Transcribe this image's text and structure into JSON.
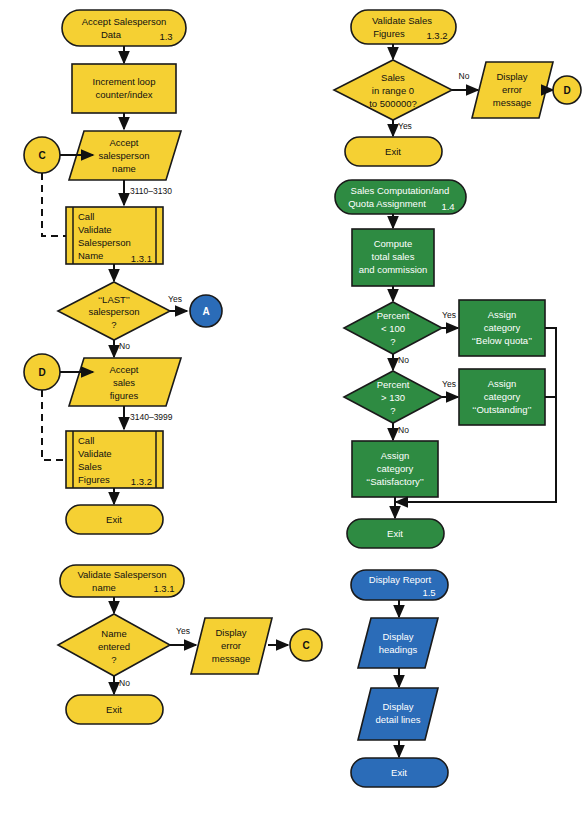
{
  "diagram": {
    "colors": {
      "yellow": "#F5D033",
      "green": "#2E8B42",
      "blue": "#2B6CB8",
      "stroke": "#111111",
      "background": "#FFFFFF"
    }
  },
  "module_1_3": {
    "terminator_start": {
      "line1": "Accept Salesperson",
      "line2": "Data",
      "ref": "1.3"
    },
    "process_increment": {
      "line1": "Increment loop",
      "line2": "counter/index"
    },
    "io_accept_name": {
      "line1": "Accept",
      "line2": "salesperson",
      "line3": "name"
    },
    "line_ref_1": "3110–3130",
    "predefined_validate_name": {
      "line1": "Call",
      "line2": "Validate",
      "line3": "Salesperson",
      "line4": "Name",
      "ref": "1.3.1"
    },
    "decision_last": {
      "line1": "‘‘LAST’’",
      "line2": "salesperson",
      "line3": "?"
    },
    "decision_last_yes": "Yes",
    "decision_last_no": "No",
    "connector_a": "A",
    "connector_c": "C",
    "connector_d": "D",
    "io_accept_sales": {
      "line1": "Accept",
      "line2": "sales",
      "line3": "figures"
    },
    "line_ref_2": "3140–3999",
    "predefined_validate_figures": {
      "line1": "Call",
      "line2": "Validate",
      "line3": "Sales",
      "line4": "Figures",
      "ref": "1.3.2"
    },
    "terminator_exit": "Exit"
  },
  "module_1_3_1": {
    "terminator_start": {
      "line1": "Validate Salesperson",
      "line2": "name",
      "ref": "1.3.1"
    },
    "decision_name": {
      "line1": "Name",
      "line2": "entered",
      "line3": "?"
    },
    "decision_yes": "Yes",
    "decision_no": "No",
    "io_display_error": {
      "line1": "Display",
      "line2": "error",
      "line3": "message"
    },
    "connector_c": "C",
    "terminator_exit": "Exit"
  },
  "module_1_3_2": {
    "terminator_start": {
      "line1": "Validate Sales",
      "line2": "Figures",
      "ref": "1.3.2"
    },
    "decision_range": {
      "line1": "Sales",
      "line2": "in range 0",
      "line3": "to 500000?"
    },
    "decision_no": "No",
    "decision_yes": "Yes",
    "io_display_error": {
      "line1": "Display",
      "line2": "error",
      "line3": "message"
    },
    "connector_d": "D",
    "terminator_exit": "Exit"
  },
  "module_1_4": {
    "terminator_start": {
      "line1": "Sales Computation/and",
      "line2": "Quota Assignment",
      "ref": "1.4"
    },
    "process_compute": {
      "line1": "Compute",
      "line2": "total sales",
      "line3": "and commission"
    },
    "decision_lt100": {
      "line1": "Percent",
      "line2": "< 100",
      "line3": "?"
    },
    "decision_lt100_yes": "Yes",
    "decision_lt100_no": "No",
    "process_below_quota": {
      "line1": "Assign",
      "line2": "category",
      "line3": "‘‘Below quota’’"
    },
    "decision_gt130": {
      "line1": "Percent",
      "line2": "> 130",
      "line3": "?"
    },
    "decision_gt130_yes": "Yes",
    "decision_gt130_no": "No",
    "process_outstanding": {
      "line1": "Assign",
      "line2": "category",
      "line3": "‘‘Outstanding’’"
    },
    "process_satisfactory": {
      "line1": "Assign",
      "line2": "category",
      "line3": "‘‘Satisfactory’’"
    },
    "terminator_exit": "Exit"
  },
  "module_1_5": {
    "terminator_start": {
      "line1": "Display Report",
      "ref": "1.5"
    },
    "io_headings": {
      "line1": "Display",
      "line2": "headings"
    },
    "io_detail": {
      "line1": "Display",
      "line2": "detail lines"
    },
    "terminator_exit": "Exit"
  }
}
